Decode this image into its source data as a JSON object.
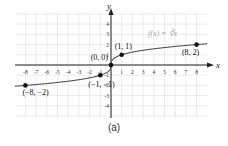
{
  "chart_data": {
    "type": "line",
    "title": "",
    "function_label": "f(x) = ∛x",
    "xlabel": "x",
    "ylabel": "y",
    "xlim": [
      -8.5,
      8.5
    ],
    "ylim": [
      -5,
      5
    ],
    "x_ticks": [
      -8,
      -7,
      -6,
      -5,
      -4,
      -3,
      -2,
      -1,
      1,
      2,
      3,
      4,
      5,
      6,
      7,
      8
    ],
    "y_ticks": [
      -4,
      -3,
      -2,
      -1,
      1,
      2,
      3,
      4
    ],
    "grid": true,
    "series": [
      {
        "name": "f(x) = ∛x",
        "x": [
          -8,
          -1,
          0,
          1,
          8
        ],
        "y": [
          -2,
          -1,
          0,
          1,
          2
        ]
      }
    ],
    "annotations": [
      {
        "label": "(-8, -2)",
        "x": -8,
        "y": -2
      },
      {
        "label": "(-1, -1)",
        "x": -1,
        "y": -1
      },
      {
        "label": "(0, 0)",
        "x": 0,
        "y": 0
      },
      {
        "label": "(1, 1)",
        "x": 1,
        "y": 1
      },
      {
        "label": "(8, 2)",
        "x": 8,
        "y": 2
      }
    ],
    "caption": "(a)"
  },
  "colors": {
    "curve": "#555555",
    "axis": "#222222",
    "grid": "#dddddd",
    "func_label": "#aaaaaa"
  }
}
